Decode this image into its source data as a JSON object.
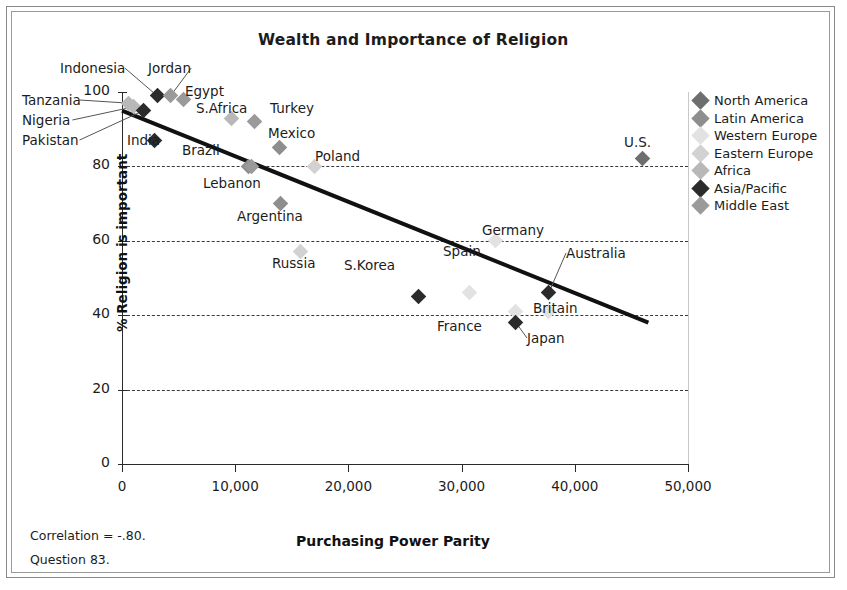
{
  "chart_data": {
    "type": "scatter",
    "title": "Wealth and Importance of Religion",
    "xlabel": "Purchasing Power Parity",
    "ylabel": "% Religion is important",
    "xlim": [
      0,
      50000
    ],
    "ylim": [
      0,
      100
    ],
    "xticks": [
      "0",
      "10,000",
      "20,000",
      "30,000",
      "40,000",
      "50,000"
    ],
    "xtick_values": [
      0,
      10000,
      20000,
      30000,
      40000,
      50000
    ],
    "yticks": [
      "0",
      "20",
      "40",
      "60",
      "80",
      "100"
    ],
    "ytick_values": [
      0,
      20,
      40,
      60,
      80,
      100
    ],
    "grid": "horizontal-dashed",
    "legend_position": "right",
    "correlation": "-.80",
    "trendline": {
      "x0": 0,
      "y0": 95,
      "x1": 46500,
      "y1": 38
    },
    "points": [
      {
        "label": "Indonesia",
        "x": 3100,
        "y": 99,
        "group": "Asia/Pacific",
        "lx": 60,
        "ly": 60,
        "leader": true
      },
      {
        "label": "Jordan",
        "x": 4300,
        "y": 99,
        "group": "Middle East",
        "lx": 148,
        "ly": 60,
        "leader": true
      },
      {
        "label": "Egypt",
        "x": 5400,
        "y": 98,
        "group": "Middle East",
        "lx": 185,
        "ly": 83,
        "leader": false
      },
      {
        "label": "Tanzania",
        "x": 600,
        "y": 97,
        "group": "Africa",
        "lx": 22,
        "ly": 92,
        "leader": true
      },
      {
        "label": "Nigeria",
        "x": 1000,
        "y": 96,
        "group": "Africa",
        "lx": 22,
        "ly": 112,
        "leader": true
      },
      {
        "label": "Pakistan",
        "x": 1900,
        "y": 95,
        "group": "Asia/Pacific",
        "lx": 22,
        "ly": 132,
        "leader": true
      },
      {
        "label": "S.Africa",
        "x": 9700,
        "y": 93,
        "group": "Africa",
        "lx": 196,
        "ly": 100,
        "leader": false
      },
      {
        "label": "Turkey",
        "x": 11700,
        "y": 92,
        "group": "Middle East",
        "lx": 270,
        "ly": 100,
        "leader": false
      },
      {
        "label": "India",
        "x": 2900,
        "y": 87,
        "group": "Asia/Pacific",
        "lx": 127,
        "ly": 132,
        "leader": false
      },
      {
        "label": "Mexico",
        "x": 13900,
        "y": 85,
        "group": "Latin America",
        "lx": 268,
        "ly": 125,
        "leader": false
      },
      {
        "label": "Brazil",
        "x": 11200,
        "y": 80,
        "group": "Latin America",
        "lx": 182,
        "ly": 142,
        "leader": false
      },
      {
        "label": "Poland",
        "x": 17000,
        "y": 80,
        "group": "Eastern Europe",
        "lx": 315,
        "ly": 148,
        "leader": false
      },
      {
        "label": "Lebanon",
        "x": 11400,
        "y": 80,
        "group": "Middle East",
        "lx": 203,
        "ly": 175,
        "leader": false
      },
      {
        "label": "Argentina",
        "x": 14000,
        "y": 70,
        "group": "Latin America",
        "lx": 237,
        "ly": 208,
        "leader": false
      },
      {
        "label": "Germany",
        "x": 33000,
        "y": 60,
        "group": "Western Europe",
        "lx": 482,
        "ly": 222,
        "leader": false
      },
      {
        "label": "Russia",
        "x": 15800,
        "y": 57,
        "group": "Eastern Europe",
        "lx": 272,
        "ly": 255,
        "leader": false
      },
      {
        "label": "Australia",
        "x": 37700,
        "y": 46,
        "group": "Asia/Pacific",
        "lx": 566,
        "ly": 245,
        "leader": true
      },
      {
        "label": "Spain",
        "x": 30700,
        "y": 46,
        "group": "Western Europe",
        "lx": 443,
        "ly": 243,
        "leader": false
      },
      {
        "label": "S.Korea",
        "x": 26200,
        "y": 45,
        "group": "Asia/Pacific",
        "lx": 344,
        "ly": 257,
        "leader": false
      },
      {
        "label": "Britain",
        "x": 37700,
        "y": 41,
        "group": "Western Europe",
        "lx": 533,
        "ly": 300,
        "leader": false
      },
      {
        "label": "France",
        "x": 34800,
        "y": 41,
        "group": "Western Europe",
        "lx": 437,
        "ly": 318,
        "leader": false
      },
      {
        "label": "Japan",
        "x": 34800,
        "y": 38,
        "group": "Asia/Pacific",
        "lx": 527,
        "ly": 330,
        "leader": true
      },
      {
        "label": "U.S.",
        "x": 46000,
        "y": 82,
        "group": "North America",
        "lx": 624,
        "ly": 134,
        "leader": false
      }
    ]
  },
  "legend": {
    "items": [
      {
        "label": "North America",
        "color": "#6e6e6e"
      },
      {
        "label": "Latin America",
        "color": "#8e8e8e"
      },
      {
        "label": "Western Europe",
        "color": "#e2e2e2"
      },
      {
        "label": "Eastern Europe",
        "color": "#d2d2d2"
      },
      {
        "label": "Africa",
        "color": "#b8b8b8"
      },
      {
        "label": "Asia/Pacific",
        "color": "#2b2b2b"
      },
      {
        "label": "Middle East",
        "color": "#9a9a9a"
      }
    ]
  },
  "footnotes": {
    "correlation": "Correlation = -.80.",
    "question": "Question 83."
  }
}
